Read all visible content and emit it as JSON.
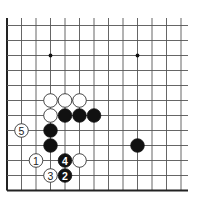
{
  "diagram": {
    "type": "go-board-fragment",
    "visible_columns": 13,
    "visible_rows": 12,
    "edges": [
      "left",
      "bottom"
    ],
    "geometry": {
      "origin_x": 7,
      "origin_y": 25.5,
      "col_spacing": 14.5,
      "row_spacing": 15,
      "open_top_extent": 18,
      "open_right_extent": 188,
      "stone_radius": 6.8
    },
    "star_points": [
      {
        "col": 3,
        "row": 2
      },
      {
        "col": 9,
        "row": 2
      }
    ],
    "stones": [
      {
        "color": "white",
        "col": 3,
        "row": 5
      },
      {
        "color": "white",
        "col": 4,
        "row": 5
      },
      {
        "color": "white",
        "col": 5,
        "row": 5
      },
      {
        "color": "white",
        "col": 3,
        "row": 6
      },
      {
        "color": "black",
        "col": 4,
        "row": 6
      },
      {
        "color": "black",
        "col": 5,
        "row": 6
      },
      {
        "color": "black",
        "col": 6,
        "row": 6
      },
      {
        "color": "black",
        "col": 3,
        "row": 7
      },
      {
        "color": "black",
        "col": 3,
        "row": 8
      },
      {
        "color": "black",
        "col": 9,
        "row": 8
      },
      {
        "color": "white",
        "col": 5,
        "row": 9
      }
    ],
    "numbered_moves": [
      {
        "number": "1",
        "color": "white",
        "col": 2,
        "row": 9
      },
      {
        "number": "2",
        "color": "black",
        "col": 4,
        "row": 10
      },
      {
        "number": "3",
        "color": "white",
        "col": 3,
        "row": 10
      },
      {
        "number": "4",
        "color": "black",
        "col": 4,
        "row": 9
      },
      {
        "number": "5",
        "color": "white",
        "col": 1,
        "row": 7
      }
    ],
    "colors": {
      "board_background": "#ffffff",
      "grid": "#555555",
      "edge": "#222222",
      "black_stone": "#111111",
      "white_stone": "#ffffff"
    }
  }
}
